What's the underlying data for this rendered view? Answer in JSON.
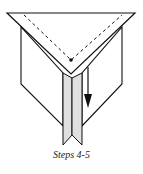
{
  "diagram": {
    "type": "origami-fold-step",
    "caption": "Steps 4-5",
    "colors": {
      "stroke": "#111111",
      "paper": "#ffffff",
      "strip_fill": "#e0e0e0"
    },
    "elements": [
      "top-triangle-flap",
      "dashed-fold-line",
      "reference-dot",
      "left-panel",
      "right-panel",
      "center-strip",
      "down-arrow"
    ]
  }
}
